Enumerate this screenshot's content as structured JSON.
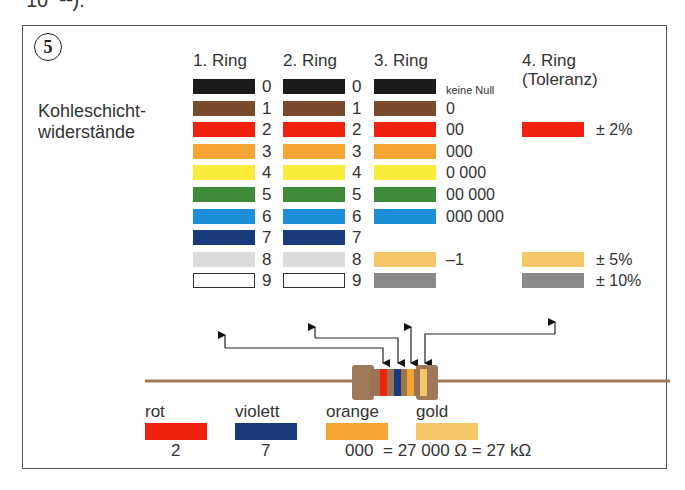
{
  "top_text": "10⁻¹¹).",
  "figure": {
    "number": "5",
    "title_line1": "Kohleschicht-",
    "title_line2": "widerstände",
    "headers": {
      "ring1": "1. Ring",
      "ring2": "2. Ring",
      "ring3": "3. Ring",
      "ring4_line1": "4. Ring",
      "ring4_line2": "(Toleranz)"
    },
    "rows": [
      {
        "digit": "0",
        "color": "#1c1a1b",
        "ring3_label": "keine Null",
        "ring4": null
      },
      {
        "digit": "1",
        "color": "#7a4a2c",
        "ring3_label": "0",
        "ring4": null
      },
      {
        "digit": "2",
        "color": "#f0210e",
        "ring3_label": "00",
        "ring4": {
          "color": "#f0210e",
          "label": "± 2%"
        }
      },
      {
        "digit": "3",
        "color": "#f4a431",
        "ring3_label": "000",
        "ring4": null
      },
      {
        "digit": "4",
        "color": "#fbeb3b",
        "ring3_label": "0 000",
        "ring4": null
      },
      {
        "digit": "5",
        "color": "#3e8c3a",
        "ring3_label": "00 000",
        "ring4": null
      },
      {
        "digit": "6",
        "color": "#1c8fd8",
        "ring3_label": "000 000",
        "ring4": null
      },
      {
        "digit": "7",
        "color": "#193a7c",
        "ring3_label": null,
        "ring4": null
      },
      {
        "digit": "8",
        "color": "#dcdcdc",
        "ring3_label": "–1",
        "ring3_color": "#f6c768",
        "ring4": {
          "color": "#f6c768",
          "label": "± 5%"
        }
      },
      {
        "digit": "9",
        "color": "#ffffff",
        "ring3_label": "",
        "ring3_color": "#8a8a8a",
        "ring4": {
          "color": "#8a8a8a",
          "label": "± 10%"
        }
      }
    ],
    "example": {
      "bands": [
        {
          "name": "rot",
          "color": "#f0210e",
          "value": "2"
        },
        {
          "name": "violett",
          "color": "#193a7c",
          "value": "7"
        },
        {
          "name": "orange",
          "color": "#f4a431",
          "value": "000"
        },
        {
          "name": "gold",
          "color": "#f6c768",
          "value": ""
        }
      ],
      "result": "= 27 000 Ω = 27 kΩ"
    },
    "resistor": {
      "body_color": "#a0785a",
      "wire_color": "#a0785a"
    }
  }
}
